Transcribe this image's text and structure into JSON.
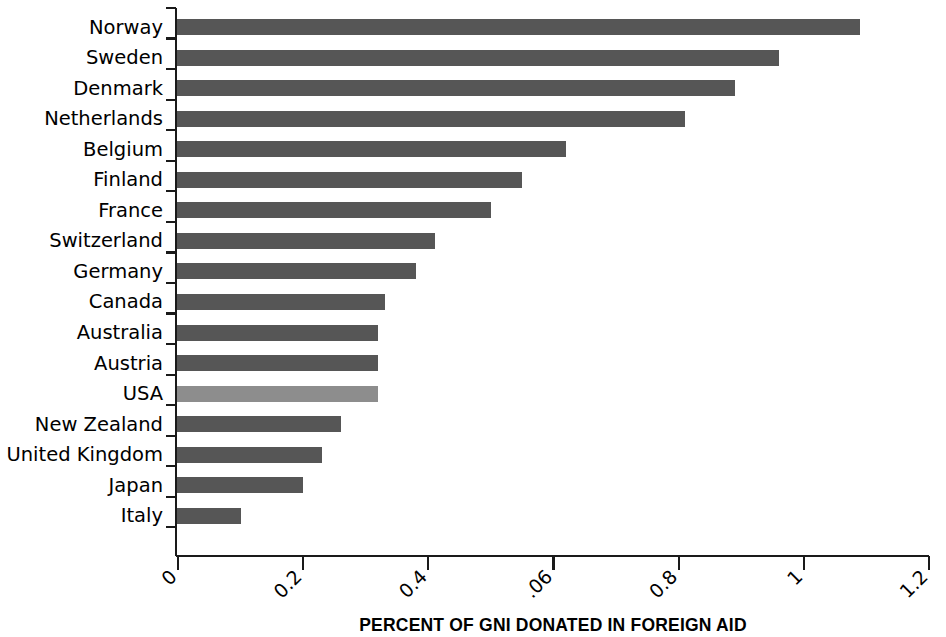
{
  "chart_data": {
    "type": "bar",
    "orientation": "horizontal",
    "title": "",
    "xlabel": "PERCENT OF GNI DONATED IN FOREIGN AID",
    "ylabel": "",
    "xlim": [
      0,
      1.2
    ],
    "grid": false,
    "legend": null,
    "xtick_labels": [
      "0",
      "0.2",
      "0.4",
      ".06",
      "0.8",
      "1",
      "1.2"
    ],
    "xtick_values": [
      0,
      0.2,
      0.4,
      0.6,
      0.8,
      1.0,
      1.2
    ],
    "xtick_rotation_deg": 45,
    "categories": [
      "Norway",
      "Sweden",
      "Denmark",
      "Netherlands",
      "Belgium",
      "Finland",
      "France",
      "Switzerland",
      "Germany",
      "Canada",
      "Australia",
      "Austria",
      "USA",
      "New Zealand",
      "United Kingdom",
      "Japan",
      "Italy"
    ],
    "values": [
      1.09,
      0.96,
      0.89,
      0.81,
      0.62,
      0.55,
      0.5,
      0.41,
      0.38,
      0.33,
      0.32,
      0.32,
      0.32,
      0.26,
      0.23,
      0.2,
      0.1
    ],
    "bar_colors": [
      "#565656",
      "#565656",
      "#565656",
      "#565656",
      "#565656",
      "#565656",
      "#565656",
      "#565656",
      "#565656",
      "#565656",
      "#565656",
      "#565656",
      "#8d8d8d",
      "#565656",
      "#565656",
      "#565656",
      "#565656"
    ],
    "highlighted_category": "USA"
  },
  "colors": {
    "bar_default": "#565656",
    "bar_highlight": "#8d8d8d",
    "axis": "#1a1a1a",
    "background": "#ffffff",
    "text": "#000000"
  }
}
